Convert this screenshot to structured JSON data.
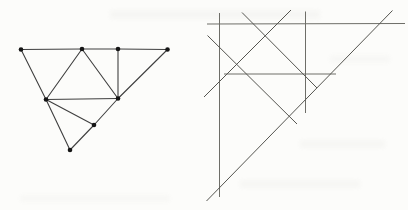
{
  "page": {
    "background_color": "#fcfcfa"
  },
  "colors": {
    "graph_edge": "#3f3f3f",
    "graph_vertex": "#151515",
    "arrangement_line": "#555550",
    "arrangement_line_light": "#6e6e68"
  },
  "figures": {
    "graph": {
      "name": "triangulated-planar-graph",
      "vertex_radius": 2.3,
      "edge_width": 1.1,
      "vertices": [
        {
          "id": "A",
          "x": 21,
          "y": 49.5
        },
        {
          "id": "B",
          "x": 82,
          "y": 49
        },
        {
          "id": "C",
          "x": 118,
          "y": 49
        },
        {
          "id": "D",
          "x": 167.5,
          "y": 49.5
        },
        {
          "id": "E",
          "x": 46,
          "y": 99.5
        },
        {
          "id": "F",
          "x": 118,
          "y": 98.5
        },
        {
          "id": "G",
          "x": 94,
          "y": 125
        },
        {
          "id": "H",
          "x": 70,
          "y": 150
        }
      ],
      "edges": [
        [
          "A",
          "B"
        ],
        [
          "B",
          "C"
        ],
        [
          "C",
          "D"
        ],
        [
          "A",
          "E"
        ],
        [
          "B",
          "E"
        ],
        [
          "B",
          "F"
        ],
        [
          "C",
          "F"
        ],
        [
          "D",
          "F"
        ],
        [
          "E",
          "F"
        ],
        [
          "E",
          "G"
        ],
        [
          "F",
          "G"
        ],
        [
          "E",
          "H"
        ],
        [
          "G",
          "H"
        ]
      ]
    },
    "arrangement": {
      "name": "line-arrangement",
      "line_width": 1,
      "lines": [
        {
          "id": "horizontal-top",
          "x1": 207,
          "y1": 24,
          "x2": 405,
          "y2": 23.5,
          "tone": "light"
        },
        {
          "id": "horizontal-mid",
          "x1": 224,
          "y1": 74,
          "x2": 336,
          "y2": 74,
          "tone": "light"
        },
        {
          "id": "vertical-left",
          "x1": 219.5,
          "y1": 13,
          "x2": 219.5,
          "y2": 197,
          "tone": "light"
        },
        {
          "id": "vertical-right",
          "x1": 305.5,
          "y1": 11.5,
          "x2": 305.5,
          "y2": 113,
          "tone": "light"
        },
        {
          "id": "diagonal-down-left",
          "x1": 207.5,
          "y1": 35.5,
          "x2": 297,
          "y2": 124,
          "tone": "dark"
        },
        {
          "id": "diagonal-down-right",
          "x1": 242,
          "y1": 12.5,
          "x2": 317,
          "y2": 88,
          "tone": "dark"
        },
        {
          "id": "diagonal-up-short",
          "x1": 204,
          "y1": 97,
          "x2": 291,
          "y2": 10,
          "tone": "dark"
        },
        {
          "id": "diagonal-up-long",
          "x1": 206.5,
          "y1": 201,
          "x2": 392.5,
          "y2": 10.5,
          "tone": "dark"
        }
      ]
    }
  }
}
